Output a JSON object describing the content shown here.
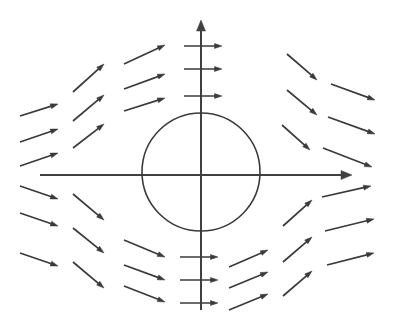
{
  "figure": {
    "name": "vector-field-around-circle",
    "type": "vector-field-diagram",
    "width": 393,
    "height": 323,
    "background_color": "#ffffff"
  },
  "style": {
    "stroke_color": "#3a3a3a",
    "circle_stroke_color": "#3a3a3a",
    "axis_stroke_color": "#404040",
    "axis_stroke_width": 2.0,
    "arrow_stroke_width": 1.7,
    "circle_stroke_width": 1.6,
    "arrow_head_length": 7.5,
    "arrow_head_width": 5.0
  },
  "chart_data": {
    "type": "scatter",
    "title": "",
    "subtitle": "",
    "xlabel": "",
    "ylabel": "",
    "grid": false,
    "legend": null,
    "annotations": [],
    "axes": {
      "origin": [
        201,
        175
      ],
      "x_axis": {
        "x1": 40,
        "y1": 175,
        "x2": 352,
        "y2": 175,
        "arrow_at": "end"
      },
      "y_axis": {
        "x1": 201,
        "y1": 310,
        "x2": 201,
        "y2": 20,
        "arrow_at": "end"
      }
    },
    "circle": {
      "cx": 201,
      "cy": 172,
      "r": 59,
      "fill": "none"
    },
    "vectors": [
      {
        "id": "ul-c1-r1",
        "x1": 20,
        "y1": 116,
        "x2": 58,
        "y2": 104
      },
      {
        "id": "ul-c1-r2",
        "x1": 20,
        "y1": 142,
        "x2": 58,
        "y2": 129
      },
      {
        "id": "ul-c1-r3",
        "x1": 20,
        "y1": 166,
        "x2": 58,
        "y2": 153
      },
      {
        "id": "ul-c2-r1",
        "x1": 73,
        "y1": 92,
        "x2": 104,
        "y2": 64
      },
      {
        "id": "ul-c2-r2",
        "x1": 73,
        "y1": 121,
        "x2": 104,
        "y2": 95
      },
      {
        "id": "ul-c2-r3",
        "x1": 73,
        "y1": 148,
        "x2": 104,
        "y2": 124
      },
      {
        "id": "ul-c3-r1",
        "x1": 124,
        "y1": 64,
        "x2": 165,
        "y2": 45
      },
      {
        "id": "ul-c3-r2",
        "x1": 124,
        "y1": 89,
        "x2": 165,
        "y2": 74
      },
      {
        "id": "ul-c3-r3",
        "x1": 124,
        "y1": 111,
        "x2": 165,
        "y2": 98
      },
      {
        "id": "axis-top-r1",
        "x1": 184,
        "y1": 46,
        "x2": 222,
        "y2": 46
      },
      {
        "id": "axis-top-r2",
        "x1": 184,
        "y1": 69,
        "x2": 222,
        "y2": 69
      },
      {
        "id": "axis-top-r3",
        "x1": 184,
        "y1": 96,
        "x2": 222,
        "y2": 96
      },
      {
        "id": "ur-c1-r1",
        "x1": 287,
        "y1": 54,
        "x2": 317,
        "y2": 80
      },
      {
        "id": "ur-c1-r2",
        "x1": 287,
        "y1": 90,
        "x2": 317,
        "y2": 115
      },
      {
        "id": "ur-c1-r3",
        "x1": 282,
        "y1": 125,
        "x2": 310,
        "y2": 150
      },
      {
        "id": "ur-c2-r1",
        "x1": 331,
        "y1": 84,
        "x2": 375,
        "y2": 100
      },
      {
        "id": "ur-c2-r2",
        "x1": 328,
        "y1": 117,
        "x2": 375,
        "y2": 134
      },
      {
        "id": "ur-c2-r3",
        "x1": 323,
        "y1": 148,
        "x2": 372,
        "y2": 167
      },
      {
        "id": "ll-c1-r1",
        "x1": 20,
        "y1": 186,
        "x2": 58,
        "y2": 199
      },
      {
        "id": "ll-c1-r2",
        "x1": 20,
        "y1": 213,
        "x2": 58,
        "y2": 226
      },
      {
        "id": "ll-c1-r3",
        "x1": 20,
        "y1": 253,
        "x2": 58,
        "y2": 266
      },
      {
        "id": "ll-c2-r1",
        "x1": 73,
        "y1": 194,
        "x2": 104,
        "y2": 220
      },
      {
        "id": "ll-c2-r2",
        "x1": 73,
        "y1": 228,
        "x2": 104,
        "y2": 253
      },
      {
        "id": "ll-c2-r3",
        "x1": 73,
        "y1": 262,
        "x2": 104,
        "y2": 288
      },
      {
        "id": "ll-c3-r1",
        "x1": 124,
        "y1": 240,
        "x2": 165,
        "y2": 257
      },
      {
        "id": "ll-c3-r2",
        "x1": 124,
        "y1": 265,
        "x2": 165,
        "y2": 280
      },
      {
        "id": "ll-c3-r3",
        "x1": 124,
        "y1": 286,
        "x2": 165,
        "y2": 302
      },
      {
        "id": "axis-bot-r1",
        "x1": 180,
        "y1": 257,
        "x2": 218,
        "y2": 257
      },
      {
        "id": "axis-bot-r2",
        "x1": 180,
        "y1": 280,
        "x2": 218,
        "y2": 280
      },
      {
        "id": "axis-bot-r3",
        "x1": 180,
        "y1": 303,
        "x2": 218,
        "y2": 303
      },
      {
        "id": "lr-c1-r1",
        "x1": 283,
        "y1": 226,
        "x2": 312,
        "y2": 200
      },
      {
        "id": "lr-c1-r2",
        "x1": 283,
        "y1": 262,
        "x2": 312,
        "y2": 237
      },
      {
        "id": "lr-c1-r3",
        "x1": 283,
        "y1": 296,
        "x2": 312,
        "y2": 271
      },
      {
        "id": "lr-c2-r1",
        "x1": 322,
        "y1": 197,
        "x2": 371,
        "y2": 186
      },
      {
        "id": "lr-c2-r2",
        "x1": 325,
        "y1": 231,
        "x2": 374,
        "y2": 219
      },
      {
        "id": "lr-c2-r3",
        "x1": 327,
        "y1": 265,
        "x2": 374,
        "y2": 253
      },
      {
        "id": "lr-c3-r1",
        "x1": 229,
        "y1": 267,
        "x2": 268,
        "y2": 250
      },
      {
        "id": "lr-c3-r2",
        "x1": 229,
        "y1": 288,
        "x2": 268,
        "y2": 272
      },
      {
        "id": "lr-c3-r3",
        "x1": 229,
        "y1": 310,
        "x2": 268,
        "y2": 294
      }
    ]
  }
}
